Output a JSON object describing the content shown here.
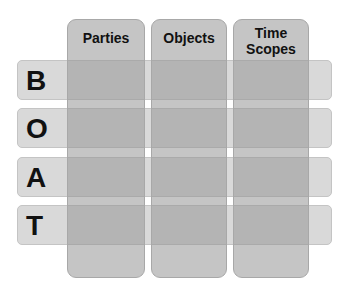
{
  "rows": [
    {
      "letter": "B",
      "top": 60
    },
    {
      "letter": "O",
      "top": 108
    },
    {
      "letter": "A",
      "top": 157
    },
    {
      "letter": "T",
      "top": 205
    }
  ],
  "columns": [
    {
      "label": "Parties",
      "left": 67,
      "width": 78
    },
    {
      "label": "Objects",
      "left": 151,
      "width": 76
    },
    {
      "label_line1": "Time",
      "label_line2": "Scopes",
      "left": 233,
      "width": 76
    }
  ],
  "colors": {
    "row_fill": "#d9d9d9",
    "column_fill": "#969696",
    "text": "#111111"
  }
}
